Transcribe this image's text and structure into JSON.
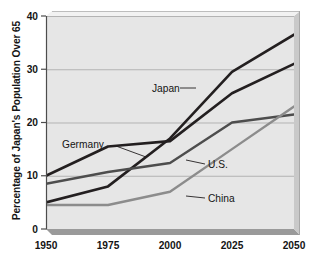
{
  "chart_data": {
    "type": "line",
    "title": "",
    "xlabel": "",
    "ylabel": "Percentage of Japan's Population Over 65",
    "x": [
      1950,
      1975,
      2000,
      2025,
      2050
    ],
    "xticklabels": [
      "1950",
      "1975",
      "2000",
      "2025",
      "2050"
    ],
    "yticklabels": [
      "0",
      "10",
      "20",
      "30",
      "40"
    ],
    "yticks": [
      0,
      10,
      20,
      30,
      40
    ],
    "xlim": [
      1950,
      2050
    ],
    "ylim": [
      0,
      40
    ],
    "grid": "horizontal",
    "legend_position": "inline-labels",
    "plot_background": "#e6e6e6",
    "series": [
      {
        "name": "Japan",
        "label": "Japan",
        "color": "#231f20",
        "width": 2.6,
        "values": [
          5.0,
          8.0,
          17.0,
          29.5,
          36.5
        ],
        "label_x": 152,
        "label_y": 92,
        "leader": "M 180 88 L 196 88"
      },
      {
        "name": "Germany",
        "label": "Germany",
        "color": "#231f20",
        "width": 2.6,
        "values": [
          10.0,
          15.5,
          16.5,
          25.5,
          31.0
        ],
        "label_x": 62,
        "label_y": 148,
        "leader": "M 116 146 L 146 157"
      },
      {
        "name": "U.S.",
        "label": "U.S.",
        "color": "#4d4d4d",
        "width": 2.4,
        "values": [
          8.5,
          10.7,
          12.4,
          20.0,
          21.5
        ],
        "label_x": 208,
        "label_y": 168,
        "leader": "M 186 160 L 205 164"
      },
      {
        "name": "China",
        "label": "China",
        "color": "#8c8c8c",
        "width": 2.4,
        "values": [
          4.5,
          4.5,
          7.0,
          15.0,
          23.0
        ],
        "label_x": 208,
        "label_y": 202,
        "leader": "M 186 196 L 205 198"
      }
    ]
  }
}
